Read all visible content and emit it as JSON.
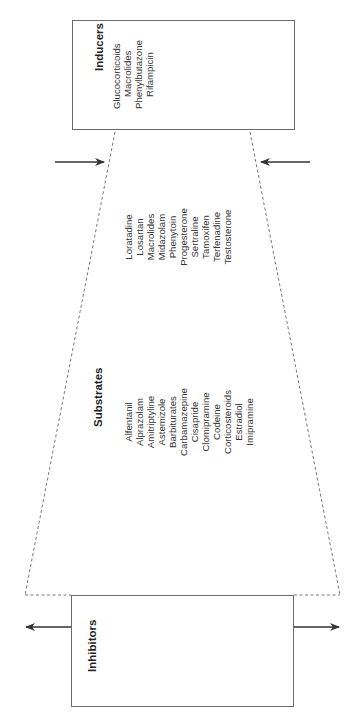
{
  "diagram": {
    "orientation": "rotated-90-ccw",
    "colors": {
      "line": "#6a6a6a",
      "arrow": "#333333",
      "text": "#222222"
    },
    "inducers": {
      "title": "Inducers",
      "items": [
        "Glucocorticoids",
        "Macrolides",
        "Phenylbutazone",
        "Rifampicin"
      ]
    },
    "substrates": {
      "title": "Substrates",
      "column_left": [
        "Alfentanil",
        "Alprazolam",
        "Amitriptyline",
        "Astemizole",
        "Barbiturates",
        "Carbamazepine",
        "Cisapride",
        "Clomipramine",
        "Codeine",
        "Corticosteroids",
        "Estradiol",
        "Imipramine"
      ],
      "column_right": [
        "Loratadine",
        "Losartan",
        "Macrolides",
        "Midazolam",
        "Phenytoin",
        "Progesterone",
        "Sertraline",
        "Tamoxifen",
        "Terfenadine",
        "Testosterone"
      ]
    },
    "inhibitors": {
      "title": "Inhibitors",
      "items": []
    },
    "arrows": [
      {
        "position": "inducer-side-left",
        "direction": "inward"
      },
      {
        "position": "inducer-side-right",
        "direction": "inward"
      },
      {
        "position": "inhibitor-side-left",
        "direction": "outward"
      },
      {
        "position": "inhibitor-side-right",
        "direction": "outward"
      }
    ]
  }
}
